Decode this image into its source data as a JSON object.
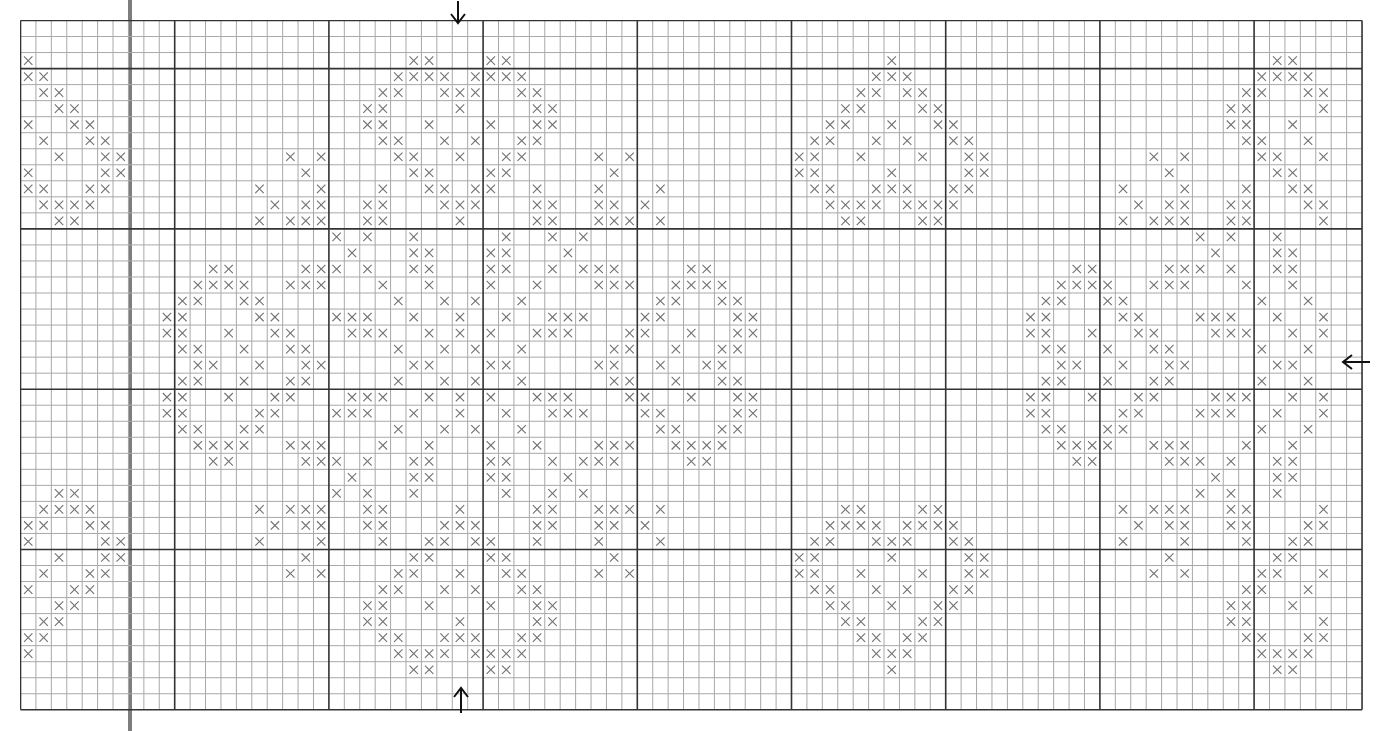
{
  "pattern": {
    "title": "",
    "columns": 87,
    "rows": 43,
    "cell_width": 15.42,
    "cell_height": 16.03,
    "major_every_col": 10,
    "major_col_offset": 0,
    "major_rows": [
      3,
      13,
      23,
      33
    ],
    "stitch_symbol": "×",
    "colors": {
      "minor_line": "#a8a8a8",
      "major_line": "#333333",
      "stitch": "#707070",
      "arrow": "#111111",
      "highlight_bar": "#7d7d7d"
    },
    "center_markers": {
      "top_arrow": {
        "direction": "down",
        "col_boundary": 28.4
      },
      "bottom_arrow": {
        "direction": "up",
        "col_boundary": 28.4
      },
      "right_arrow": {
        "direction": "left",
        "row_center": 21
      }
    },
    "highlight_bar_col": 7,
    "stitches": {
      "2": [
        0,
        25,
        26,
        30,
        31,
        56,
        81,
        82
      ],
      "3": [
        0,
        1,
        24,
        25,
        26,
        27,
        29,
        30,
        31,
        32,
        55,
        56,
        57,
        80,
        81,
        82,
        83
      ],
      "4": [
        1,
        2,
        23,
        24,
        27,
        28,
        29,
        32,
        33,
        54,
        55,
        57,
        58,
        79,
        80,
        83,
        84
      ],
      "5": [
        2,
        3,
        22,
        23,
        28,
        33,
        34,
        53,
        54,
        58,
        59,
        78,
        79,
        84
      ],
      "6": [
        0,
        3,
        4,
        22,
        23,
        26,
        30,
        33,
        34,
        52,
        53,
        56,
        59,
        60,
        78,
        79,
        82
      ],
      "7": [
        1,
        4,
        5,
        23,
        24,
        27,
        29,
        32,
        33,
        51,
        52,
        55,
        57,
        60,
        61,
        79,
        80,
        83
      ],
      "8": [
        2,
        5,
        6,
        17,
        19,
        24,
        25,
        28,
        31,
        32,
        37,
        39,
        50,
        51,
        54,
        58,
        61,
        62,
        73,
        75,
        80,
        81,
        84
      ],
      "9": [
        0,
        5,
        6,
        18,
        25,
        26,
        30,
        31,
        38,
        50,
        51,
        56,
        61,
        62,
        74,
        81,
        82
      ],
      "10": [
        0,
        1,
        4,
        5,
        15,
        19,
        23,
        26,
        27,
        29,
        30,
        33,
        37,
        41,
        51,
        52,
        55,
        56,
        57,
        60,
        61,
        71,
        75,
        79,
        82,
        83
      ],
      "11": [
        1,
        2,
        3,
        4,
        16,
        18,
        19,
        22,
        23,
        27,
        28,
        29,
        33,
        34,
        37,
        38,
        40,
        52,
        53,
        54,
        55,
        57,
        58,
        59,
        60,
        72,
        74,
        75,
        78,
        79,
        83,
        84
      ],
      "12": [
        2,
        3,
        15,
        17,
        18,
        19,
        22,
        23,
        28,
        33,
        34,
        37,
        38,
        39,
        41,
        53,
        54,
        58,
        59,
        71,
        73,
        74,
        75,
        78,
        79,
        84
      ],
      "13": [
        20,
        22,
        25,
        31,
        34,
        36,
        76,
        78,
        81
      ],
      "14": [
        21,
        25,
        26,
        30,
        31,
        35,
        77,
        81,
        82
      ],
      "15": [
        12,
        13,
        18,
        19,
        20,
        22,
        25,
        26,
        30,
        31,
        34,
        36,
        37,
        38,
        43,
        44,
        68,
        69,
        74,
        75,
        76,
        78,
        81,
        82
      ],
      "16": [
        11,
        12,
        13,
        14,
        17,
        18,
        19,
        23,
        26,
        30,
        33,
        37,
        38,
        39,
        42,
        43,
        44,
        45,
        67,
        68,
        69,
        70,
        73,
        74,
        75,
        79,
        82
      ],
      "17": [
        10,
        11,
        14,
        15,
        24,
        27,
        29,
        32,
        41,
        42,
        45,
        46,
        66,
        67,
        70,
        71,
        80,
        83
      ],
      "18": [
        9,
        10,
        15,
        16,
        20,
        21,
        22,
        25,
        28,
        31,
        34,
        35,
        36,
        40,
        41,
        46,
        47,
        65,
        66,
        71,
        72,
        76,
        77,
        78,
        81,
        84
      ],
      "19": [
        9,
        10,
        13,
        16,
        17,
        21,
        22,
        23,
        26,
        28,
        30,
        33,
        34,
        35,
        39,
        40,
        43,
        46,
        47,
        65,
        66,
        69,
        72,
        73,
        77,
        78,
        79,
        82,
        84
      ],
      "20": [
        10,
        11,
        14,
        17,
        18,
        24,
        27,
        29,
        32,
        38,
        39,
        42,
        45,
        46,
        66,
        67,
        70,
        73,
        74,
        80,
        83
      ],
      "21": [
        11,
        12,
        15,
        18,
        19,
        25,
        26,
        30,
        31,
        37,
        38,
        41,
        44,
        45,
        67,
        68,
        71,
        74,
        75,
        81,
        82
      ],
      "22": [
        10,
        11,
        14,
        17,
        18,
        24,
        27,
        29,
        32,
        38,
        39,
        42,
        45,
        46,
        66,
        67,
        70,
        73,
        74,
        80,
        83
      ],
      "23": [
        9,
        10,
        13,
        16,
        17,
        21,
        22,
        23,
        26,
        28,
        30,
        33,
        34,
        35,
        39,
        40,
        43,
        46,
        47,
        65,
        66,
        69,
        72,
        73,
        77,
        78,
        79,
        82,
        84
      ],
      "24": [
        9,
        10,
        15,
        16,
        20,
        21,
        22,
        25,
        28,
        31,
        34,
        35,
        36,
        40,
        41,
        46,
        47,
        65,
        66,
        71,
        72,
        76,
        77,
        78,
        81,
        84
      ],
      "25": [
        10,
        11,
        14,
        15,
        24,
        27,
        29,
        32,
        41,
        42,
        45,
        46,
        66,
        67,
        70,
        71,
        80,
        83
      ],
      "26": [
        11,
        12,
        13,
        14,
        17,
        18,
        19,
        23,
        26,
        30,
        33,
        37,
        38,
        39,
        42,
        43,
        44,
        45,
        67,
        68,
        69,
        70,
        73,
        74,
        75,
        79,
        82
      ],
      "27": [
        12,
        13,
        18,
        19,
        20,
        22,
        25,
        26,
        30,
        31,
        34,
        36,
        37,
        38,
        43,
        44,
        68,
        69,
        74,
        75,
        76,
        78,
        81,
        82
      ],
      "28": [
        21,
        25,
        26,
        30,
        31,
        35,
        77,
        81,
        82
      ],
      "29": [
        2,
        3,
        20,
        22,
        25,
        31,
        34,
        36,
        76,
        78,
        81
      ],
      "30": [
        1,
        2,
        3,
        4,
        15,
        17,
        18,
        19,
        22,
        23,
        28,
        33,
        34,
        37,
        38,
        39,
        41,
        53,
        54,
        58,
        59,
        71,
        73,
        74,
        75,
        78,
        79,
        84
      ],
      "31": [
        0,
        1,
        4,
        5,
        16,
        18,
        19,
        22,
        23,
        27,
        28,
        29,
        33,
        34,
        37,
        38,
        40,
        52,
        53,
        54,
        55,
        57,
        58,
        59,
        60,
        72,
        74,
        75,
        78,
        79,
        83,
        84
      ],
      "32": [
        0,
        5,
        6,
        15,
        19,
        23,
        26,
        27,
        29,
        30,
        33,
        37,
        41,
        51,
        52,
        55,
        56,
        57,
        60,
        61,
        71,
        75,
        79,
        82,
        83
      ],
      "33": [
        2,
        5,
        6,
        18,
        25,
        26,
        30,
        31,
        38,
        50,
        51,
        56,
        61,
        62,
        74,
        81,
        82
      ],
      "34": [
        1,
        4,
        5,
        17,
        19,
        24,
        25,
        28,
        31,
        32,
        37,
        39,
        50,
        51,
        54,
        58,
        61,
        62,
        73,
        75,
        80,
        81,
        84
      ],
      "35": [
        0,
        3,
        4,
        23,
        24,
        27,
        29,
        32,
        33,
        51,
        52,
        55,
        57,
        60,
        61,
        79,
        80,
        83
      ],
      "36": [
        2,
        3,
        22,
        23,
        26,
        30,
        33,
        34,
        52,
        53,
        56,
        59,
        60,
        78,
        79,
        82
      ],
      "37": [
        1,
        2,
        22,
        23,
        28,
        33,
        34,
        53,
        54,
        58,
        59,
        78,
        79,
        84
      ],
      "38": [
        0,
        1,
        23,
        24,
        27,
        28,
        29,
        32,
        33,
        54,
        55,
        57,
        58,
        79,
        80,
        83,
        84
      ],
      "39": [
        0,
        24,
        25,
        26,
        27,
        29,
        30,
        31,
        32,
        55,
        56,
        57,
        80,
        81,
        82,
        83
      ],
      "40": [
        25,
        26,
        30,
        31,
        56,
        81,
        82
      ]
    }
  }
}
